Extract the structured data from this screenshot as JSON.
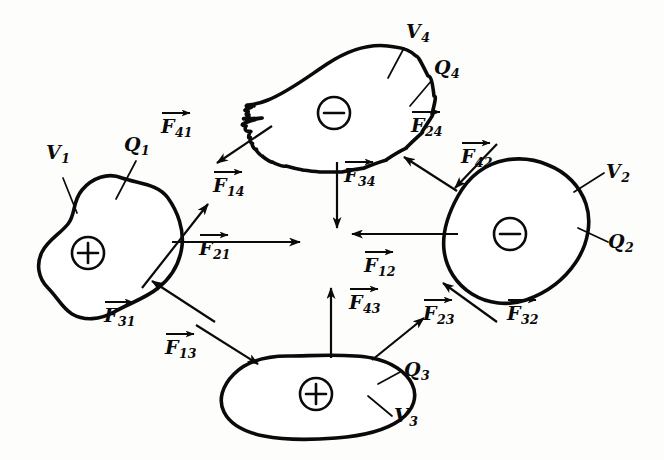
{
  "figure": {
    "background_color": "#fdfdfb",
    "ink_color": "#0a0a0a"
  },
  "bodies": [
    {
      "id": "body-1",
      "charge_sign": "+",
      "charge_glyph": "⊕",
      "volume_label": "V",
      "volume_sub": "1",
      "charge_label": "Q",
      "charge_sub": "1"
    },
    {
      "id": "body-2",
      "charge_sign": "−",
      "charge_glyph": "⊖",
      "volume_label": "V",
      "volume_sub": "2",
      "charge_label": "Q",
      "charge_sub": "2"
    },
    {
      "id": "body-3",
      "charge_sign": "+",
      "charge_glyph": "⊕",
      "volume_label": "V",
      "volume_sub": "3",
      "charge_label": "Q",
      "charge_sub": "3"
    },
    {
      "id": "body-4",
      "charge_sign": "−",
      "charge_glyph": "⊖",
      "volume_label": "V",
      "volume_sub": "4",
      "charge_label": "Q",
      "charge_sub": "4"
    }
  ],
  "forces": [
    {
      "id": "force-41",
      "symbol": "F",
      "sub": "41",
      "on_body": "1",
      "from_body": "4",
      "direction": "up-right"
    },
    {
      "id": "force-21",
      "symbol": "F",
      "sub": "21",
      "on_body": "1",
      "from_body": "2",
      "direction": "right"
    },
    {
      "id": "force-31",
      "symbol": "F",
      "sub": "31",
      "on_body": "1",
      "from_body": "3",
      "direction": "up-left"
    },
    {
      "id": "force-14",
      "symbol": "F",
      "sub": "14",
      "on_body": "4",
      "from_body": "1",
      "direction": "down-left"
    },
    {
      "id": "force-24",
      "symbol": "F",
      "sub": "24",
      "on_body": "4",
      "from_body": "2",
      "direction": "up-left"
    },
    {
      "id": "force-34",
      "symbol": "F",
      "sub": "34",
      "on_body": "4",
      "from_body": "3",
      "direction": "down"
    },
    {
      "id": "force-42",
      "symbol": "F",
      "sub": "42",
      "on_body": "2",
      "from_body": "4",
      "direction": "down-right"
    },
    {
      "id": "force-12",
      "symbol": "F",
      "sub": "12",
      "on_body": "2",
      "from_body": "1",
      "direction": "left"
    },
    {
      "id": "force-32",
      "symbol": "F",
      "sub": "32",
      "on_body": "2",
      "from_body": "3",
      "direction": "up-left"
    },
    {
      "id": "force-13",
      "symbol": "F",
      "sub": "13",
      "on_body": "3",
      "from_body": "1",
      "direction": "down-right"
    },
    {
      "id": "force-43",
      "symbol": "F",
      "sub": "43",
      "on_body": "3",
      "from_body": "4",
      "direction": "up"
    },
    {
      "id": "force-23",
      "symbol": "F",
      "sub": "23",
      "on_body": "3",
      "from_body": "2",
      "direction": "up-right"
    }
  ],
  "labels": {
    "v1": "V",
    "v1_sub": "1",
    "q1": "Q",
    "q1_sub": "1",
    "v2": "V",
    "v2_sub": "2",
    "q2": "Q",
    "q2_sub": "2",
    "v3": "V",
    "v3_sub": "3",
    "q3": "Q",
    "q3_sub": "3",
    "v4": "V",
    "v4_sub": "4",
    "q4": "Q",
    "q4_sub": "4",
    "f41": "F",
    "f41_sub": "41",
    "f21": "F",
    "f21_sub": "21",
    "f31": "F",
    "f31_sub": "31",
    "f14": "F",
    "f14_sub": "14",
    "f24": "F",
    "f24_sub": "24",
    "f34": "F",
    "f34_sub": "34",
    "f42": "F",
    "f42_sub": "42",
    "f12": "F",
    "f12_sub": "12",
    "f32": "F",
    "f32_sub": "32",
    "f13": "F",
    "f13_sub": "13",
    "f43": "F",
    "f43_sub": "43",
    "f23": "F",
    "f23_sub": "23"
  }
}
